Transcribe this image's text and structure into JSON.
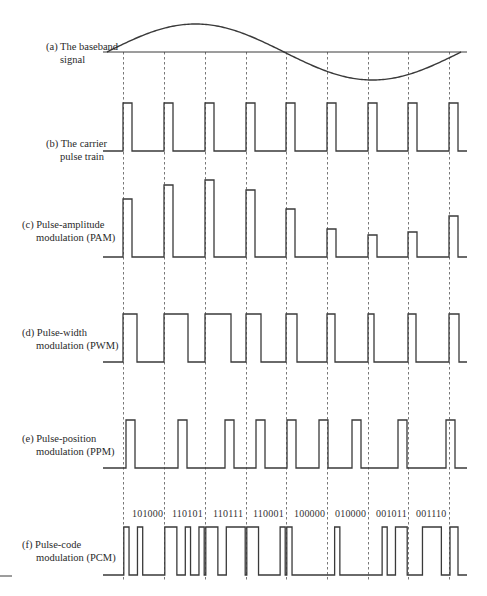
{
  "panels": [
    {
      "id": "a",
      "line1": "(a) The baseband",
      "line2": "signal",
      "label_y": 45
    },
    {
      "id": "b",
      "line1": "(b) The carrier",
      "line2": "pulse train",
      "label_y": 150
    },
    {
      "id": "c",
      "line1": "(c) Pulse-amplitude",
      "line2": "modulation (PAM)",
      "label_y": 218
    },
    {
      "id": "d",
      "line1": "(d) Pulse-width",
      "line2": "modulation (PWM)",
      "label_y": 322
    },
    {
      "id": "e",
      "line1": "(e) Pulse-position",
      "line2": "modulation (PPM)",
      "label_y": 433
    },
    {
      "id": "f",
      "line1": "(f) Pulse-code",
      "line2": "modulation (PCM)",
      "label_y": 542
    }
  ],
  "pcm_codes": [
    "101000",
    "110101",
    "110111",
    "110001",
    "100000",
    "010000",
    "001011",
    "001110"
  ],
  "colors": {
    "stroke": "#3a3a3a",
    "dashed": "#555555",
    "text": "#2a2a2a"
  },
  "chart_data": {
    "type": "line",
    "sample_x": [
      123,
      164,
      205,
      246,
      286,
      327,
      368,
      408,
      449
    ],
    "baseband": {
      "axis_y": 52,
      "x_start": 107,
      "x_end": 461,
      "amplitude_px": 28,
      "axis_x1": 103,
      "axis_x2": 467
    },
    "carrier": {
      "top": 103,
      "base": 151,
      "width": 9
    },
    "pam": {
      "base": 257,
      "tops": [
        199,
        185,
        180,
        190,
        209,
        229,
        235,
        232,
        216
      ],
      "width": 9
    },
    "pwm": {
      "top": 314,
      "base": 362,
      "widths": [
        14,
        24,
        26,
        15,
        11,
        8,
        6,
        8,
        10
      ]
    },
    "ppm": {
      "top": 420,
      "base": 468,
      "starts": [
        126,
        178,
        225,
        256,
        287,
        319,
        352,
        398,
        446
      ],
      "width": 9
    },
    "pcm": {
      "top": 527,
      "base": 575,
      "bit_width": 6.4,
      "codes": [
        "101000",
        "110101",
        "110111",
        "110001",
        "100000",
        "010000",
        "001011",
        "001110"
      ]
    }
  }
}
